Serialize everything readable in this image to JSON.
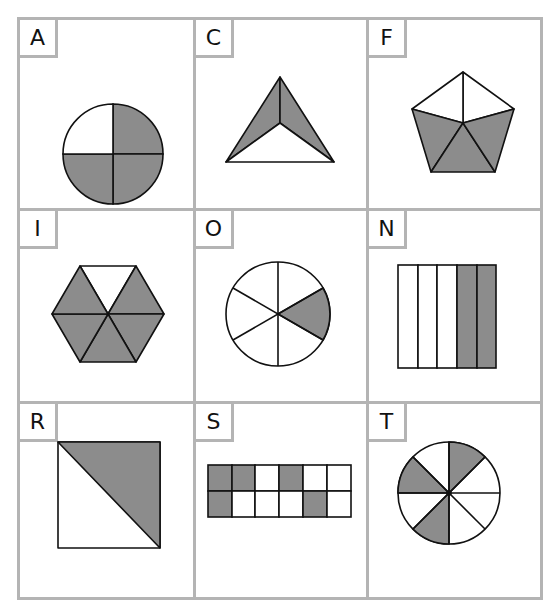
{
  "fill_color": "#8c8c8c",
  "stroke_color": "#111111",
  "grid_color": "#b4b4b4",
  "cells": [
    {
      "label": "A",
      "shape": "circle",
      "parts": 4,
      "shaded": 3,
      "fraction": "3/4"
    },
    {
      "label": "C",
      "shape": "triangle",
      "parts": 3,
      "shaded": 2,
      "fraction": "2/3"
    },
    {
      "label": "F",
      "shape": "pentagon",
      "parts": 5,
      "shaded": 3,
      "fraction": "3/5"
    },
    {
      "label": "I",
      "shape": "hexagon",
      "parts": 6,
      "shaded": 5,
      "fraction": "5/6"
    },
    {
      "label": "O",
      "shape": "circle",
      "parts": 6,
      "shaded": 1,
      "fraction": "1/6"
    },
    {
      "label": "N",
      "shape": "rectangle-strips",
      "parts": 5,
      "shaded": 2,
      "fraction": "2/5"
    },
    {
      "label": "R",
      "shape": "square-diagonal",
      "parts": 2,
      "shaded": 1,
      "fraction": "1/2"
    },
    {
      "label": "S",
      "shape": "grid-2x6",
      "parts": 12,
      "shaded": 5,
      "fraction": "5/12"
    },
    {
      "label": "T",
      "shape": "circle",
      "parts": 8,
      "shaded": 3,
      "fraction": "3/8"
    }
  ]
}
